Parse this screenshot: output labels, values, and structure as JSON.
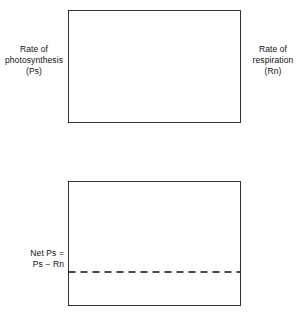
{
  "top_panel": {
    "left_axis_label": "Rate of\nphotosynthesis\n(Ps)",
    "right_axis_label": "Rate of\nrespiration\n(Rn)",
    "curve_labels": {
      "ps": "Ps",
      "rn": "Rn"
    },
    "x_tick_labels": [
      "30",
      "50",
      "70",
      "90",
      "110",
      "130"
    ],
    "x_unit_label": "°F"
  },
  "bottom_panel": {
    "left_axis_label": "Net Ps =\nPs − Rn",
    "y_markers": {
      "positive": "+",
      "zero": "0",
      "negative": "−"
    }
  },
  "chart_data": [
    {
      "type": "line",
      "title": "Rate of photosynthesis and respiration vs temperature",
      "xlabel": "Temperature (°F)",
      "ylabel": "Rate",
      "xlim": [
        30,
        130
      ],
      "ylim": [
        0,
        100
      ],
      "grid": false,
      "legend": "inline-curve-labels",
      "x_ticks": [
        30,
        50,
        70,
        90,
        110,
        130
      ],
      "x_tick_labels": [
        "30",
        "50",
        "70",
        "90",
        "110",
        "130"
      ],
      "x_unit": "°F",
      "series": [
        {
          "name": "Ps",
          "label": "Rate of photosynthesis (Ps)",
          "style": "solid",
          "x": [
            32,
            36,
            40,
            45,
            50,
            55,
            60,
            65,
            70,
            75,
            80,
            85,
            90,
            95,
            100,
            105,
            110,
            115,
            120,
            125,
            130
          ],
          "y": [
            0,
            9,
            18,
            29,
            40,
            49,
            57,
            64,
            71,
            77,
            82,
            86,
            89,
            91,
            92,
            91,
            89,
            86,
            82,
            77,
            71
          ]
        },
        {
          "name": "Rn",
          "label": "Rate of respiration (Rn)",
          "style": "dashed",
          "x": [
            45,
            50,
            55,
            60,
            65,
            70,
            75,
            80,
            85,
            90,
            95,
            100,
            105,
            110,
            115,
            120,
            125,
            130
          ],
          "y": [
            2,
            4,
            6,
            9,
            13,
            17,
            22,
            28,
            34,
            41,
            48,
            56,
            64,
            72,
            81,
            90,
            99,
            108
          ]
        }
      ],
      "annotations": [
        {
          "text": "Ps",
          "x": 56,
          "y": 83
        },
        {
          "text": "Rn",
          "x": 91,
          "y": 46
        }
      ]
    },
    {
      "type": "line",
      "title": "Net photosynthesis vs temperature",
      "xlabel": "Temperature (°F)",
      "ylabel": "Net Ps = Ps − Rn",
      "xlim": [
        30,
        130
      ],
      "ylim": [
        -25,
        80
      ],
      "grid": false,
      "y_markers": [
        "+",
        "0",
        "−"
      ],
      "zero_line": 0,
      "series": [
        {
          "name": "Net Ps",
          "label": "Net Ps = Ps − Rn",
          "style": "solid",
          "x": [
            32,
            36,
            40,
            45,
            50,
            55,
            60,
            65,
            70,
            75,
            80,
            85,
            90,
            95,
            100,
            105,
            110,
            115,
            120,
            125,
            128
          ],
          "y": [
            0,
            7,
            14,
            25,
            35,
            43,
            49,
            54,
            58,
            61,
            63,
            64,
            63,
            61,
            57,
            51,
            42,
            30,
            14,
            -6,
            -16
          ]
        }
      ]
    }
  ]
}
